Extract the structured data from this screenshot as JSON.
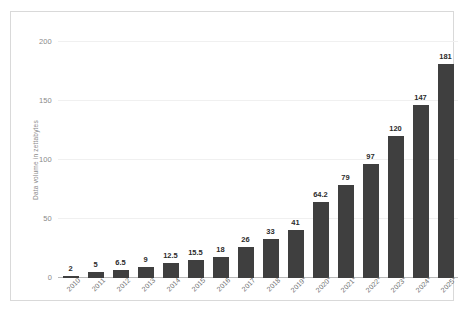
{
  "chart_data": {
    "type": "bar",
    "title": "",
    "subtitle": "",
    "xlabel": "",
    "ylabel": "Data volume in zettabytes",
    "ylim": [
      0,
      200
    ],
    "yticks": [
      0,
      50,
      100,
      150,
      200
    ],
    "ytick_labels": [
      "0",
      "50",
      "100",
      "150",
      "200"
    ],
    "grid": true,
    "legend": false,
    "bar_color": "#3f3f3f",
    "categories": [
      "2010",
      "2011",
      "2012",
      "2013",
      "2014",
      "2015",
      "2016",
      "2017",
      "2018",
      "2019*",
      "2020*",
      "2021*",
      "2022*",
      "2023*",
      "2024*",
      "2025*"
    ],
    "values": [
      2,
      5,
      6.5,
      9,
      12.5,
      15.5,
      18,
      26,
      33,
      41,
      64.2,
      79,
      97,
      120,
      147,
      181
    ],
    "value_labels": [
      "2",
      "5",
      "6.5",
      "9",
      "12.5",
      "15.5",
      "18",
      "26",
      "33",
      "41",
      "64.2",
      "79",
      "97",
      "120",
      "147",
      "181"
    ],
    "annotations": []
  },
  "axes": {
    "y_title": "Data volume in zettabytes",
    "y_ticks": [
      {
        "label": "200",
        "value": 200
      },
      {
        "label": "150",
        "value": 150
      },
      {
        "label": "100",
        "value": 100
      },
      {
        "label": "50",
        "value": 50
      },
      {
        "label": "0",
        "value": 0
      }
    ]
  },
  "colors": {
    "bar": "#3f3f3f",
    "gridline": "#f0f0f0",
    "baseline": "#b9b9b9",
    "frame": "#d9d9d9",
    "tick_text": "#8a8a8a",
    "category_text": "#6d6d6d",
    "value_text": "#2b2b2b",
    "background": "#ffffff"
  }
}
